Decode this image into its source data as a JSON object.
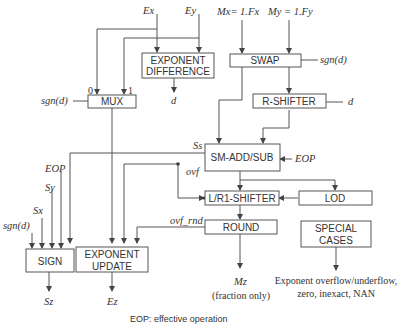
{
  "blocks": {
    "exponent_difference": [
      "EXPONENT",
      "DIFFERENCE"
    ],
    "swap": "SWAP",
    "mux": "MUX",
    "r_shifter": "R-SHIFTER",
    "sm_add_sub": "SM-ADD/SUB",
    "lr1_shifter": "L/R1-SHIFTER",
    "lod": "LOD",
    "round": "ROUND",
    "special_cases": [
      "SPECIAL",
      "CASES"
    ],
    "sign": "SIGN",
    "exponent_update": [
      "EXPONENT",
      "UPDATE"
    ]
  },
  "signals": {
    "ex": "Ex",
    "ey": "Ey",
    "mx": "Mx= 1.Fx",
    "my": "My = 1.Fy",
    "sgn_d": "sgn(d)",
    "d": "d",
    "mux_in0": "0",
    "mux_in1": "1",
    "ss": "Ss",
    "ovf": "ovf",
    "eop": "EOP",
    "sy": "Sy",
    "sx": "Sx",
    "ovf_rnd": "ovf_rnd",
    "mz": "Mz",
    "sz": "Sz",
    "ez": "Ez"
  },
  "notes": {
    "fraction_only": "(fraction only)",
    "special_out_1": "Exponent overflow/underflow,",
    "special_out_2": "zero, inexact, NAN",
    "footnote": "EOP: effective operation"
  }
}
